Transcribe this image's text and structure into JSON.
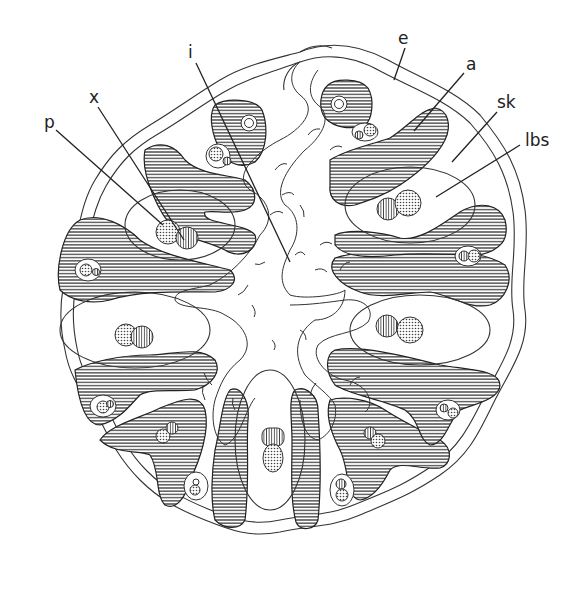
{
  "figure": {
    "type": "cross-section line drawing",
    "labels": [
      {
        "id": "e",
        "text": "e",
        "x": 398,
        "y": 44
      },
      {
        "id": "a",
        "text": "a",
        "x": 466,
        "y": 70
      },
      {
        "id": "sk",
        "text": "sk",
        "x": 497,
        "y": 108
      },
      {
        "id": "lbs",
        "text": "lbs",
        "x": 525,
        "y": 146
      },
      {
        "id": "i",
        "text": "i",
        "x": 188,
        "y": 58
      },
      {
        "id": "x",
        "text": "x",
        "x": 89,
        "y": 103
      },
      {
        "id": "p",
        "text": "p",
        "x": 44,
        "y": 128
      }
    ],
    "colors": {
      "ink": "#222222",
      "background": "#ffffff"
    }
  }
}
